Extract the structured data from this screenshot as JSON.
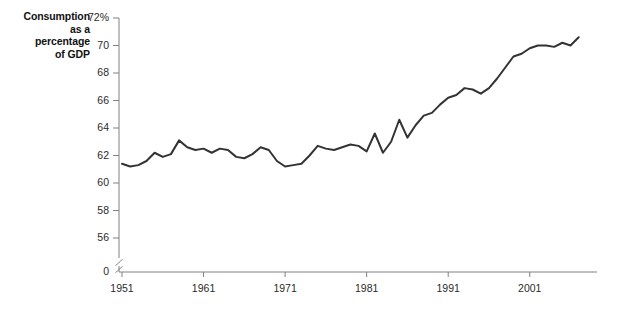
{
  "chart_data": {
    "type": "line",
    "title": "Consumption\nas a\npercentage\nof GDP",
    "title_lines": [
      "Consumption",
      "as a",
      "percentage",
      "of GDP"
    ],
    "xlabel": "",
    "ylabel": "Consumption as a percentage of GDP",
    "grid": false,
    "legend": "none",
    "axis_break": true,
    "axis_break_note": "y-axis broken between 0 and 56",
    "ylim": [
      56,
      72
    ],
    "yticks": [
      "72%",
      "70",
      "68",
      "66",
      "64",
      "62",
      "60",
      "58",
      "56",
      "0"
    ],
    "ytick_values": [
      72,
      70,
      68,
      66,
      64,
      62,
      60,
      58,
      56,
      0
    ],
    "xlim": [
      1951,
      2007
    ],
    "xticks": [
      "1951",
      "1961",
      "1971",
      "1981",
      "1991",
      "2001"
    ],
    "xtick_values": [
      1951,
      1961,
      1971,
      1981,
      1991,
      2001
    ],
    "line_color": "#333333",
    "series": [
      {
        "name": "Consumption as a percentage of GDP",
        "x": [
          1951,
          1952,
          1953,
          1954,
          1955,
          1956,
          1957,
          1958,
          1959,
          1960,
          1961,
          1962,
          1963,
          1964,
          1965,
          1966,
          1967,
          1968,
          1969,
          1970,
          1971,
          1972,
          1973,
          1974,
          1975,
          1976,
          1977,
          1978,
          1979,
          1980,
          1981,
          1982,
          1983,
          1984,
          1985,
          1986,
          1987,
          1988,
          1989,
          1990,
          1991,
          1992,
          1993,
          1994,
          1995,
          1996,
          1997,
          1998,
          1999,
          2000,
          2001,
          2002,
          2003,
          2004,
          2005,
          2006,
          2007
        ],
        "values": [
          61.4,
          61.2,
          61.3,
          61.6,
          62.2,
          61.9,
          62.1,
          63.1,
          62.6,
          62.4,
          62.5,
          62.2,
          62.5,
          62.4,
          61.9,
          61.8,
          62.1,
          62.6,
          62.4,
          61.6,
          61.2,
          61.3,
          61.4,
          62.0,
          62.7,
          62.5,
          62.4,
          62.6,
          62.8,
          62.7,
          62.3,
          63.6,
          62.2,
          63.0,
          64.6,
          63.3,
          64.2,
          64.9,
          65.1,
          65.7,
          66.2,
          66.4,
          66.9,
          66.8,
          66.5,
          66.9,
          67.6,
          68.4,
          69.2,
          69.4,
          69.8,
          70.0,
          70.0,
          69.9,
          70.2,
          70.0,
          70.6
        ]
      }
    ]
  }
}
